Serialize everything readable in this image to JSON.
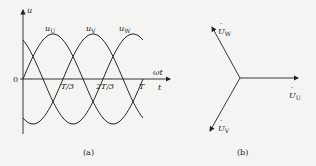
{
  "figure": {
    "panel_a": {
      "caption": "(a)",
      "y_axis_label": "u",
      "x_axis_label_top": "ωt",
      "x_axis_label_bottom": "t",
      "origin_label": "0",
      "ticks": [
        "T/3",
        "2T/3",
        "T"
      ],
      "curves": [
        {
          "name": "u_U",
          "label_main": "u",
          "label_sub": "U",
          "phase_deg": 0
        },
        {
          "name": "u_V",
          "label_main": "u",
          "label_sub": "V",
          "phase_deg": -120
        },
        {
          "name": "u_W",
          "label_main": "u",
          "label_sub": "W",
          "phase_deg": 120
        }
      ]
    },
    "panel_b": {
      "caption": "(b)",
      "phasors": [
        {
          "name": "U_U",
          "label_main": "U",
          "label_sub": "U",
          "angle_deg": 0
        },
        {
          "name": "U_V",
          "label_main": "U",
          "label_sub": "V",
          "angle_deg": -120
        },
        {
          "name": "U_W",
          "label_main": "U",
          "label_sub": "W",
          "angle_deg": 120
        }
      ]
    }
  },
  "chart_data": {
    "type": "line",
    "xlabel": "ωt / t",
    "ylabel": "u",
    "x_ticks": [
      "0",
      "T/3",
      "2T/3",
      "T"
    ],
    "series": [
      {
        "name": "u_U",
        "function": "Um·sin(ωt)"
      },
      {
        "name": "u_V",
        "function": "Um·sin(ωt − 120°)"
      },
      {
        "name": "u_W",
        "function": "Um·sin(ωt + 120°)"
      }
    ]
  }
}
